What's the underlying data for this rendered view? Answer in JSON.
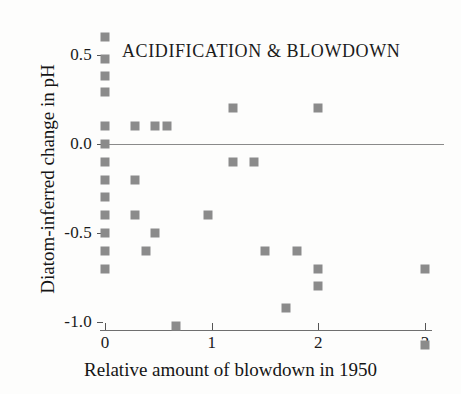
{
  "chart_data": {
    "type": "scatter",
    "title": "ACIDIFICATION & BLOWDOWN",
    "xlabel": "Relative amount of blowdown in 1950",
    "ylabel": "Diatom-inferred change in pH",
    "xlim": [
      -0.12,
      3.15
    ],
    "ylim": [
      -1.18,
      0.62
    ],
    "grid": false,
    "legend": null,
    "marker_color": "#8b8b8b",
    "zero_line": 0.0,
    "xticks": [
      0,
      1,
      2,
      3
    ],
    "xtick_labels": [
      "0",
      "1",
      "2",
      "3"
    ],
    "yticks": [
      0.5,
      0.0,
      -0.5,
      -1.0
    ],
    "ytick_labels": [
      "0.5",
      "0.0",
      "-0.5",
      "-1.0"
    ],
    "points": [
      {
        "x": 0.0,
        "y": 0.6
      },
      {
        "x": 0.0,
        "y": 0.48
      },
      {
        "x": 0.0,
        "y": 0.38
      },
      {
        "x": 0.0,
        "y": 0.29
      },
      {
        "x": 0.0,
        "y": 0.1
      },
      {
        "x": 0.0,
        "y": 0.0
      },
      {
        "x": 0.0,
        "y": -0.1
      },
      {
        "x": 0.0,
        "y": -0.2
      },
      {
        "x": 0.0,
        "y": -0.3
      },
      {
        "x": 0.0,
        "y": -0.4
      },
      {
        "x": 0.0,
        "y": -0.5
      },
      {
        "x": 0.0,
        "y": -0.6
      },
      {
        "x": 0.0,
        "y": -0.7
      },
      {
        "x": 0.28,
        "y": 0.1
      },
      {
        "x": 0.28,
        "y": -0.2
      },
      {
        "x": 0.28,
        "y": -0.4
      },
      {
        "x": 0.38,
        "y": -0.6
      },
      {
        "x": 0.47,
        "y": 0.1
      },
      {
        "x": 0.47,
        "y": -0.5
      },
      {
        "x": 0.58,
        "y": 0.1
      },
      {
        "x": 0.67,
        "y": -1.02
      },
      {
        "x": 0.97,
        "y": -0.4
      },
      {
        "x": 1.2,
        "y": 0.2
      },
      {
        "x": 1.2,
        "y": -0.1
      },
      {
        "x": 1.4,
        "y": -0.1
      },
      {
        "x": 1.5,
        "y": -0.6
      },
      {
        "x": 1.7,
        "y": -0.92
      },
      {
        "x": 1.8,
        "y": -0.6
      },
      {
        "x": 2.0,
        "y": 0.2
      },
      {
        "x": 2.0,
        "y": -0.7
      },
      {
        "x": 2.0,
        "y": -0.8
      },
      {
        "x": 3.0,
        "y": -0.7
      },
      {
        "x": 3.0,
        "y": -1.13
      }
    ]
  }
}
